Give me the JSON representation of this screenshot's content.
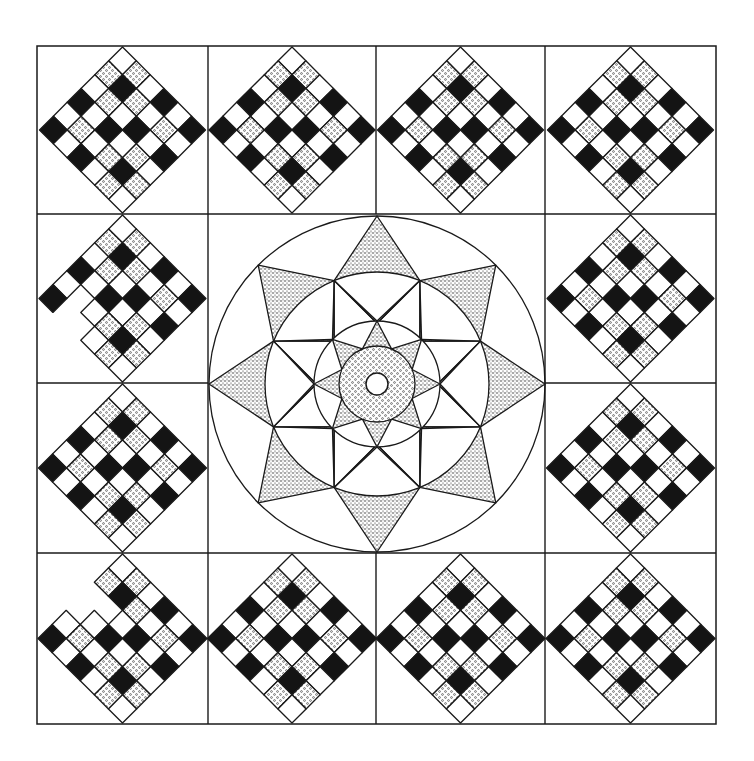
{
  "colors": {
    "background": "#ffffff",
    "line": "#1a1a1a",
    "dark": "#141414",
    "light": "#ffffff",
    "dot": "#2a2a2a"
  },
  "layout": {
    "x_edges": [
      37,
      208,
      376,
      545,
      716
    ],
    "y_edges": [
      46,
      214,
      383,
      553,
      724
    ]
  },
  "diamond_block": {
    "grid": 6,
    "cell_pattern_legend": {
      "W": "white",
      "D": "dotted",
      "B": "black"
    },
    "cells": [
      [
        "W",
        "D",
        "W",
        "B",
        "W",
        "B"
      ],
      [
        "D",
        "B",
        "D",
        "W",
        "D",
        "W"
      ],
      [
        "W",
        "D",
        "W",
        "B",
        "W",
        "B"
      ],
      [
        "B",
        "W",
        "B",
        "W",
        "D",
        "W"
      ],
      [
        "W",
        "D",
        "W",
        "D",
        "B",
        "D"
      ],
      [
        "B",
        "W",
        "B",
        "W",
        "D",
        "W"
      ]
    ]
  },
  "blocks": [
    {
      "row": 0,
      "col": 0,
      "missing": []
    },
    {
      "row": 0,
      "col": 1,
      "missing": []
    },
    {
      "row": 0,
      "col": 2,
      "missing": []
    },
    {
      "row": 0,
      "col": 3,
      "missing": []
    },
    {
      "row": 1,
      "col": 0,
      "missing": [
        [
          4,
          1
        ],
        [
          5,
          1
        ],
        [
          5,
          2
        ]
      ]
    },
    {
      "row": 1,
      "col": 3,
      "missing": []
    },
    {
      "row": 2,
      "col": 0,
      "missing": []
    },
    {
      "row": 2,
      "col": 3,
      "missing": []
    },
    {
      "row": 3,
      "col": 0,
      "missing": [
        [
          2,
          0
        ],
        [
          3,
          0
        ],
        [
          2,
          1
        ]
      ]
    },
    {
      "row": 3,
      "col": 1,
      "missing": []
    },
    {
      "row": 3,
      "col": 2,
      "missing": []
    },
    {
      "row": 3,
      "col": 3,
      "missing": []
    }
  ],
  "medallion": {
    "center": [
      377,
      384
    ],
    "outer_circle_r": 168,
    "big_star_point_r": 168,
    "middle_circle_r": 112,
    "inner_circle_r": 63,
    "small_star_point_r": 63,
    "small_star_inner_r": 38,
    "ring_circle_r": 38,
    "hole_r": 11
  }
}
